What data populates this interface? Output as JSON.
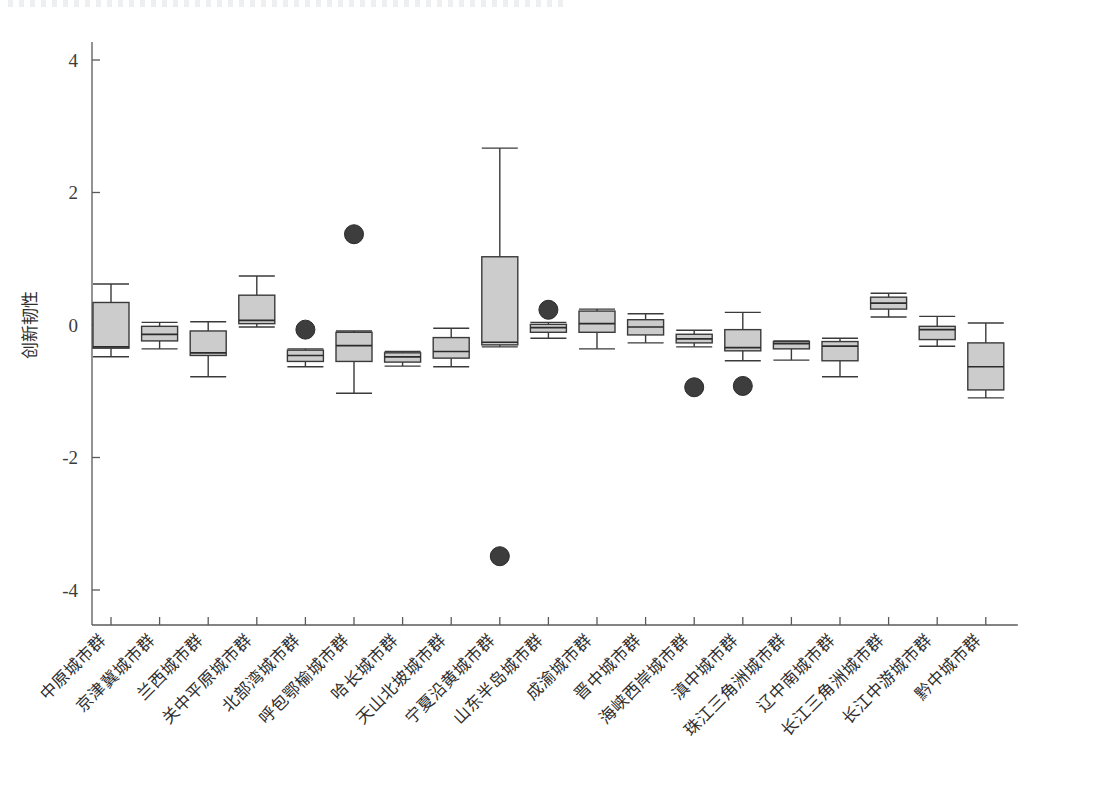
{
  "figure": {
    "title": "",
    "background_color": "#ffffff",
    "box_fill_color": "#cccccc",
    "line_color": "#3a3a3a",
    "outlier_color": "#3d3d3d"
  },
  "axes": {
    "y_title": "创新韧性",
    "y_ticks": [
      "4",
      "2",
      "0",
      "-2",
      "-4"
    ],
    "y_tick_values": [
      4,
      2,
      0,
      -2,
      -4
    ],
    "ylim": [
      -4.6,
      4.55
    ],
    "x_title": "",
    "grid": "off",
    "legend": "none"
  },
  "chart_data": {
    "type": "boxplot",
    "title": "",
    "xlabel": "",
    "ylabel": "创新韧性",
    "ylim": [
      -4.6,
      4.55
    ],
    "grid": false,
    "legend": null,
    "categories": [
      "中原城市群",
      "京津冀城市群",
      "兰西城市群",
      "关中平原城市群",
      "北部湾城市群",
      "呼包鄂榆城市群",
      "哈长城市群",
      "天山北坡城市群",
      "宁夏沿黄城市群",
      "山东半岛城市群",
      "成渝城市群",
      "晋中城市群",
      "海峡西岸城市群",
      "滇中城市群",
      "珠江三角洲城市群",
      "辽中南城市群",
      "长江三角洲城市群",
      "长江中游城市群",
      "黔中城市群"
    ],
    "boxes": [
      {
        "category": "中原城市群",
        "min": -0.48,
        "q1": -0.35,
        "median": -0.33,
        "q3": 0.34,
        "max": 0.62,
        "outliers": []
      },
      {
        "category": "京津冀城市群",
        "min": -0.36,
        "q1": -0.24,
        "median": -0.14,
        "q3": -0.02,
        "max": 0.04,
        "outliers": []
      },
      {
        "category": "兰西城市群",
        "min": -0.78,
        "q1": -0.46,
        "median": -0.42,
        "q3": -0.09,
        "max": 0.05,
        "outliers": []
      },
      {
        "category": "关中平原城市群",
        "min": -0.03,
        "q1": 0.02,
        "median": 0.07,
        "q3": 0.45,
        "max": 0.74,
        "outliers": []
      },
      {
        "category": "北部湾城市群",
        "min": -0.63,
        "q1": -0.55,
        "median": -0.46,
        "q3": -0.38,
        "max": -0.36,
        "outliers": [
          -0.07
        ]
      },
      {
        "category": "呼包鄂榆城市群",
        "min": -1.03,
        "q1": -0.55,
        "median": -0.31,
        "q3": -0.11,
        "max": -0.09,
        "outliers": [
          1.37
        ]
      },
      {
        "category": "哈长城市群",
        "min": -0.62,
        "q1": -0.56,
        "median": -0.48,
        "q3": -0.42,
        "max": -0.4,
        "outliers": []
      },
      {
        "category": "天山北坡城市群",
        "min": -0.63,
        "q1": -0.5,
        "median": -0.4,
        "q3": -0.19,
        "max": -0.05,
        "outliers": []
      },
      {
        "category": "宁夏沿黄城市群",
        "min": -0.33,
        "q1": -0.3,
        "median": -0.26,
        "q3": 1.03,
        "max": 2.67,
        "outliers": [
          -3.49
        ]
      },
      {
        "category": "山东半岛城市群",
        "min": -0.2,
        "q1": -0.11,
        "median": -0.04,
        "q3": 0.01,
        "max": 0.04,
        "outliers": [
          0.23
        ]
      },
      {
        "category": "成渝城市群",
        "min": -0.36,
        "q1": -0.11,
        "median": 0.02,
        "q3": 0.21,
        "max": 0.24,
        "outliers": []
      },
      {
        "category": "晋中城市群",
        "min": -0.27,
        "q1": -0.15,
        "median": -0.03,
        "q3": 0.08,
        "max": 0.17,
        "outliers": []
      },
      {
        "category": "海峡西岸城市群",
        "min": -0.33,
        "q1": -0.27,
        "median": -0.21,
        "q3": -0.14,
        "max": -0.08,
        "outliers": [
          -0.94
        ]
      },
      {
        "category": "滇中城市群",
        "min": -0.54,
        "q1": -0.39,
        "median": -0.34,
        "q3": -0.07,
        "max": 0.19,
        "outliers": [
          -0.92
        ]
      },
      {
        "category": "珠江三角洲城市群",
        "min": -0.53,
        "q1": -0.36,
        "median": -0.28,
        "q3": -0.25,
        "max": -0.24,
        "outliers": []
      },
      {
        "category": "辽中南城市群",
        "min": -0.78,
        "q1": -0.54,
        "median": -0.32,
        "q3": -0.25,
        "max": -0.2,
        "outliers": []
      },
      {
        "category": "长江三角洲城市群",
        "min": 0.12,
        "q1": 0.24,
        "median": 0.33,
        "q3": 0.42,
        "max": 0.48,
        "outliers": []
      },
      {
        "category": "长江中游城市群",
        "min": -0.32,
        "q1": -0.22,
        "median": -0.07,
        "q3": -0.02,
        "max": 0.13,
        "outliers": []
      },
      {
        "category": "黔中城市群",
        "min": -1.1,
        "q1": -0.98,
        "median": -0.63,
        "q3": -0.27,
        "max": 0.03,
        "outliers": []
      }
    ]
  }
}
